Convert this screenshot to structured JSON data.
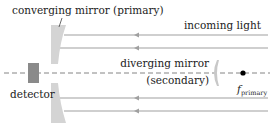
{
  "labels": {
    "primary": "converging mirror (primary)",
    "incoming": "incoming light",
    "secondary_line1": "diverging mirror",
    "secondary_line2": "(secondary)",
    "detector": "detector",
    "focus_main": "f",
    "focus_sub": "primary"
  },
  "colors": {
    "mirror_fill": "#d4d4d4",
    "detector_fill": "#8a8a8a",
    "ray": "#999999",
    "axis": "#777777",
    "focus_dot": "#000000",
    "text": "#222222"
  }
}
